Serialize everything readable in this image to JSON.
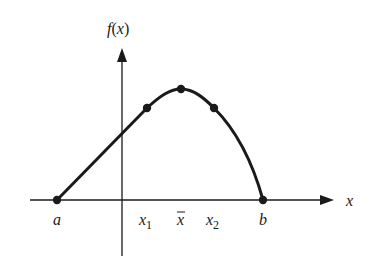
{
  "diagram": {
    "y_axis_label_f": "f",
    "y_axis_label_open": "(",
    "y_axis_label_var": "x",
    "y_axis_label_close": ")",
    "x_axis_label": "x",
    "colors": {
      "ink": "#1a1a1a",
      "background": "#ffffff"
    },
    "points": [
      {
        "name": "a",
        "label": "a",
        "sub": ""
      },
      {
        "name": "x1",
        "label": "x",
        "sub": "1"
      },
      {
        "name": "xbar",
        "label": "x",
        "sub": "",
        "bar": "¯"
      },
      {
        "name": "x2",
        "label": "x",
        "sub": "2"
      },
      {
        "name": "b",
        "label": "b",
        "sub": ""
      }
    ]
  }
}
